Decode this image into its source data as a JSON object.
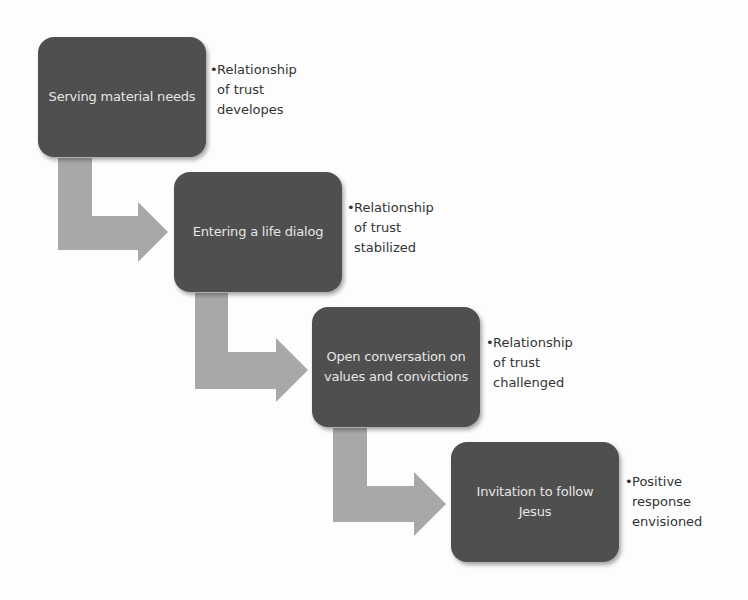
{
  "diagram": {
    "type": "staggered-step-process",
    "colors": {
      "box_fill": "#4f4f4f",
      "box_text": "#e6e6e6",
      "arrow_fill": "#a8a8a8",
      "note_text": "#333333",
      "background": "#fdfdfd"
    },
    "steps": [
      {
        "label": "Serving material needs",
        "note_bullet": "•",
        "note_lines": [
          "Relationship",
          "of trust",
          "developes"
        ]
      },
      {
        "label": "Entering a life dialog",
        "note_bullet": "•",
        "note_lines": [
          "Relationship",
          "of trust",
          "stabilized"
        ]
      },
      {
        "label": "Open conversation on values and convictions",
        "note_bullet": "•",
        "note_lines": [
          "Relationship",
          "of trust",
          "challenged"
        ]
      },
      {
        "label": "Invitation to follow Jesus",
        "note_bullet": "•",
        "note_lines": [
          "Positive",
          "response",
          "envisioned"
        ]
      }
    ],
    "connectors": [
      {
        "from": 0,
        "to": 1,
        "shape": "bent-arrow-right"
      },
      {
        "from": 1,
        "to": 2,
        "shape": "bent-arrow-right"
      },
      {
        "from": 2,
        "to": 3,
        "shape": "bent-arrow-right"
      }
    ]
  }
}
